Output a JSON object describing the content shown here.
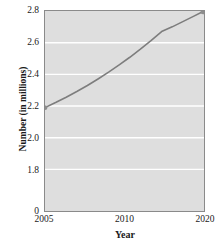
{
  "chart_data": {
    "type": "line",
    "title": "",
    "xlabel": "Year",
    "ylabel": "Number (in millions)",
    "xlim": [
      2005,
      2020
    ],
    "ylim": [
      1.7,
      2.8
    ],
    "grid": true,
    "legend": false,
    "y_axis_break": true,
    "y_break_label": "0",
    "xticks": [
      {
        "value": 2005,
        "label": "2005",
        "pos_pct": 0
      },
      {
        "value": 2010,
        "label": "2010",
        "pos_pct": 50
      },
      {
        "value": 2020,
        "label": "2020",
        "pos_pct": 100
      }
    ],
    "yticks": [
      {
        "value": 2.8,
        "label": "2.8",
        "top_px": 5
      },
      {
        "value": 2.6,
        "label": "2.6",
        "top_px": 37
      },
      {
        "value": 2.4,
        "label": "2.4",
        "top_px": 69
      },
      {
        "value": 2.2,
        "label": "2.2",
        "top_px": 101
      },
      {
        "value": 2.0,
        "label": "2.0",
        "top_px": 133
      },
      {
        "value": 1.8,
        "label": "1.8",
        "top_px": 165
      },
      {
        "value": 0,
        "label": "0",
        "top_px": 206
      }
    ],
    "gridlines_y": [
      2.6,
      2.4,
      2.2,
      2.0,
      1.8
    ],
    "series": [
      {
        "name": "Number (in millions)",
        "color": "#7d7d7d",
        "markers_at_endpoints": true,
        "x": [
          2005,
          2006,
          2007,
          2008,
          2009,
          2010,
          2011,
          2012,
          2013,
          2014,
          2015,
          2016,
          2017,
          2018,
          2019,
          2020
        ],
        "values": [
          2.19,
          2.222,
          2.256,
          2.292,
          2.33,
          2.371,
          2.414,
          2.46,
          2.508,
          2.559,
          2.613,
          2.67,
          2.7,
          2.733,
          2.766,
          2.8
        ]
      }
    ]
  },
  "colors": {
    "plot_background": "#dedede",
    "gridline": "#ffffff",
    "axis": "#8a8a8a",
    "curve": "#7d7d7d",
    "text": "#1a1a1a"
  }
}
